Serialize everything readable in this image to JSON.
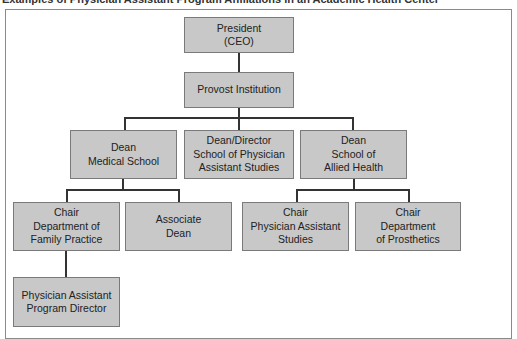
{
  "title": "Examples of Physician Assistant Program Affiliations in an Academic Health Center",
  "chart": {
    "nodes": [
      {
        "id": "president",
        "label": "President\n(CEO)"
      },
      {
        "id": "provost",
        "label": "Provost Institution"
      },
      {
        "id": "dean-medical",
        "label": "Dean\nMedical School"
      },
      {
        "id": "dean-director-pa",
        "label": "Dean/Director\nSchool of Physician\nAssistant Studies"
      },
      {
        "id": "dean-allied",
        "label": "Dean\nSchool of\nAllied Health"
      },
      {
        "id": "chair-family",
        "label": "Chair\nDepartment of\nFamily Practice"
      },
      {
        "id": "associate-dean",
        "label": "Associate\nDean"
      },
      {
        "id": "chair-pa-studies",
        "label": "Chair\nPhysician Assistant\nStudies"
      },
      {
        "id": "chair-prosthetics",
        "label": "Chair\nDepartment\nof Prosthetics"
      },
      {
        "id": "pa-program-director",
        "label": "Physician Assistant\nProgram Director"
      }
    ],
    "edges": [
      [
        "president",
        "provost"
      ],
      [
        "provost",
        "dean-medical"
      ],
      [
        "provost",
        "dean-director-pa"
      ],
      [
        "provost",
        "dean-allied"
      ],
      [
        "dean-medical",
        "chair-family"
      ],
      [
        "dean-medical",
        "associate-dean"
      ],
      [
        "dean-allied",
        "chair-pa-studies"
      ],
      [
        "dean-allied",
        "chair-prosthetics"
      ],
      [
        "chair-family",
        "pa-program-director"
      ]
    ]
  }
}
